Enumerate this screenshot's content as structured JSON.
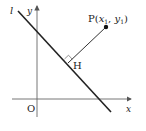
{
  "diagram": {
    "type": "coordinate-geometry",
    "labels": {
      "line": "l",
      "y_axis": "y",
      "x_axis": "x",
      "origin": "O",
      "foot": "H",
      "point_name": "P",
      "point_open": "(",
      "point_x": "x",
      "point_x_sub": "1",
      "point_sep": ", ",
      "point_y": "y",
      "point_y_sub": "1",
      "point_close": ")"
    },
    "colors": {
      "stroke": "#222222",
      "axis": "#666666"
    }
  }
}
